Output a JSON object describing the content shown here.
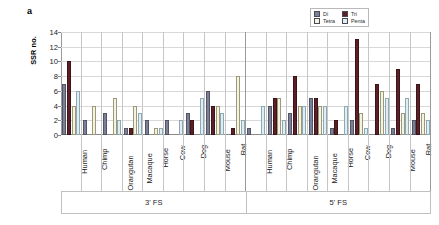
{
  "figure": {
    "panel_letter": "a"
  },
  "legend": {
    "position": "top-right",
    "items": [
      {
        "label": "Di",
        "color": "#7b7f9e"
      },
      {
        "label": "Tri",
        "color": "#5c1f28"
      },
      {
        "label": "Tetra",
        "color": "#f5f2e0"
      },
      {
        "label": "Penta",
        "color": "#dfeef2"
      }
    ]
  },
  "chart_data": {
    "type": "bar",
    "title": "",
    "xlabel": "",
    "ylabel": "SSR no.",
    "ylim": [
      0,
      14
    ],
    "yticks": [
      0,
      2,
      4,
      6,
      8,
      10,
      12,
      14
    ],
    "grid": true,
    "legend_position": "top-right",
    "group_labels": [
      "3' FS",
      "5' FS"
    ],
    "categories": [
      "Human",
      "Chimp",
      "Orangutan",
      "Macaque",
      "Horse",
      "Cow",
      "Dog",
      "Mouse",
      "Rat"
    ],
    "panels": [
      {
        "name": "3' FS",
        "series": [
          {
            "name": "Di",
            "values": [
              7,
              2,
              3,
              1,
              2,
              2,
              3,
              6,
              0
            ]
          },
          {
            "name": "Tri",
            "values": [
              10,
              0,
              0,
              1,
              0,
              0,
              2,
              4,
              1
            ]
          },
          {
            "name": "Tetra",
            "values": [
              4,
              4,
              5,
              4,
              1,
              0,
              0,
              4,
              8
            ]
          },
          {
            "name": "Penta",
            "values": [
              6,
              0,
              2,
              3,
              1,
              2,
              5,
              3,
              2
            ]
          }
        ]
      },
      {
        "name": "5' FS",
        "series": [
          {
            "name": "Di",
            "values": [
              1,
              4,
              3,
              5,
              1,
              2,
              0,
              1,
              2
            ]
          },
          {
            "name": "Tri",
            "values": [
              0,
              5,
              8,
              5,
              2,
              13,
              7,
              9,
              7
            ]
          },
          {
            "name": "Tetra",
            "values": [
              0,
              5,
              4,
              4,
              0,
              3,
              6,
              3,
              3
            ]
          },
          {
            "name": "Penta",
            "values": [
              4,
              2,
              4,
              4,
              4,
              1,
              5,
              5,
              2
            ]
          }
        ]
      }
    ]
  }
}
